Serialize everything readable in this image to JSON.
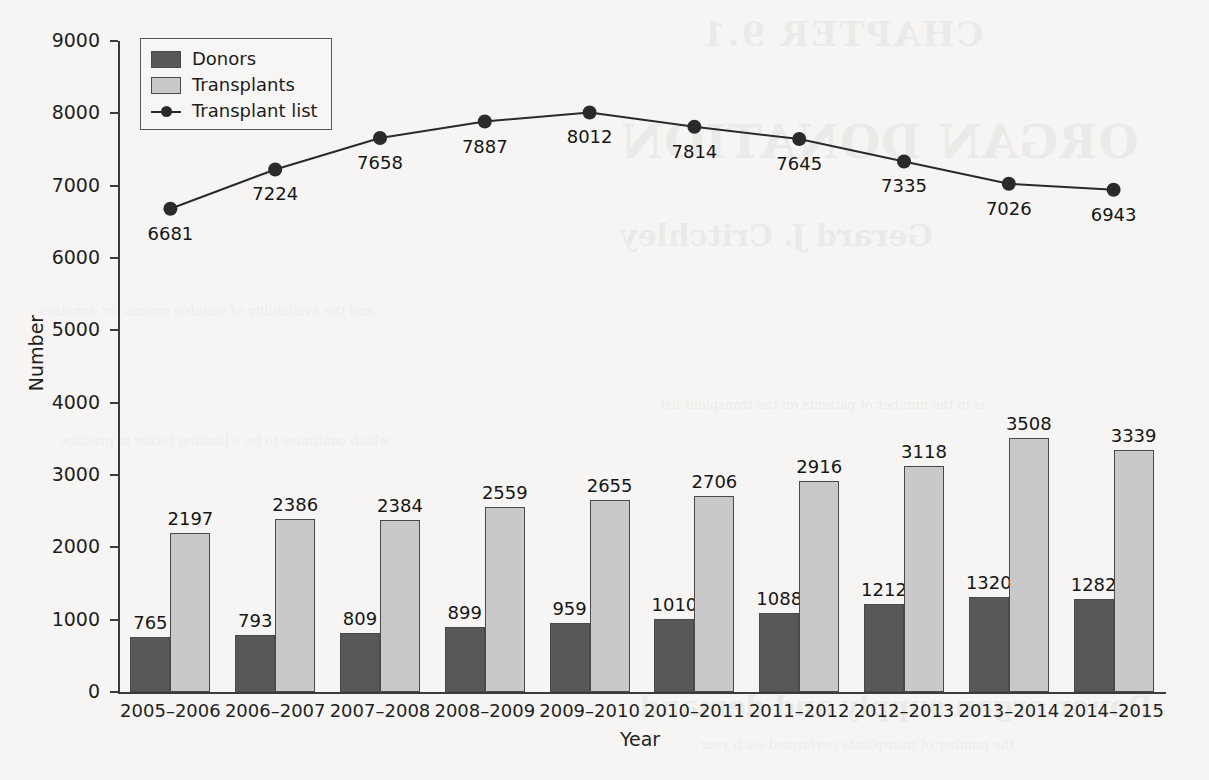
{
  "chart_data": {
    "type": "bar",
    "title": "",
    "xlabel": "Year",
    "ylabel": "Number",
    "ylim": [
      0,
      9000
    ],
    "ytick_step": 1000,
    "yticks": [
      "9000",
      "8000",
      "7000",
      "6000",
      "5000",
      "4000",
      "3000",
      "2000",
      "1000",
      "0"
    ],
    "grid": false,
    "legend_position": "upper left",
    "categories": [
      "2005–2006",
      "2006–2007",
      "2007–2008",
      "2008–2009",
      "2009–2010",
      "2010–2011",
      "2011–2012",
      "2012–2013",
      "2013–2014",
      "2014–2015"
    ],
    "series": [
      {
        "name": "Donors",
        "kind": "bar",
        "color": "#58585a",
        "values": [
          765,
          793,
          809,
          899,
          959,
          1010,
          1088,
          1212,
          1320,
          1282
        ]
      },
      {
        "name": "Transplants",
        "kind": "bar",
        "color": "#c9c9c9",
        "values": [
          2197,
          2386,
          2384,
          2559,
          2655,
          2706,
          2916,
          3118,
          3508,
          3339
        ]
      },
      {
        "name": "Transplant list",
        "kind": "line",
        "color": "#2a2a2a",
        "values": [
          6681,
          7224,
          7658,
          7887,
          8012,
          7814,
          7645,
          7335,
          7026,
          6943
        ]
      }
    ]
  },
  "legend": {
    "items": [
      {
        "label": "Donors",
        "swatch": "donors"
      },
      {
        "label": "Transplants",
        "swatch": "transplants"
      },
      {
        "label": "Transplant list",
        "swatch": "line"
      }
    ]
  },
  "bleed_through": {
    "line1": "CHAPTER 9.1",
    "line2": "ORGAN DONATION",
    "line3": "Gerard J. Critchley",
    "line4": "Donor organ supply and demand",
    "body1": "is in the number of patients on the transplant list",
    "body2": "and the availability of suitable organs for donation",
    "body3": "which continues to be a limiting factor in practice",
    "body4": "the number of transplants performed each year"
  }
}
